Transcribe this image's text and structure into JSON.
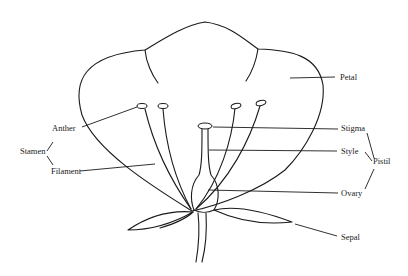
{
  "diagram": {
    "labels": {
      "petal": "Petal",
      "anther": "Anther",
      "stamen": "Stamen",
      "filament": "Filament",
      "stigma": "Stigma",
      "style": "Style",
      "pistil": "Pistil",
      "ovary": "Ovary",
      "sepal": "Sepal"
    },
    "groups": [
      {
        "name": "Stamen",
        "parts": [
          "Anther",
          "Filament"
        ]
      },
      {
        "name": "Pistil",
        "parts": [
          "Stigma",
          "Style",
          "Ovary"
        ]
      }
    ],
    "colors": {
      "line": "#1a1a1a",
      "background": "#ffffff"
    }
  }
}
